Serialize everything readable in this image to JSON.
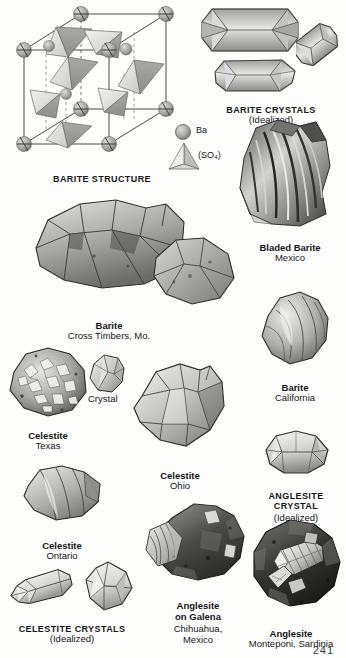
{
  "page": {
    "page_number": "241",
    "background_color": "#fdfdfb",
    "ink_color": "#15161a"
  },
  "structure_diagram": {
    "caption": "BARITE STRUCTURE",
    "legend": [
      {
        "symbol": "sphere",
        "label": "Ba"
      },
      {
        "symbol": "tetrahedron",
        "label": "(SO₄)"
      }
    ]
  },
  "figures": [
    {
      "id": "barite-crystals-idealized",
      "name": "barite-crystals-idealized",
      "caption": "BARITE CRYSTALS",
      "subcaption": "(Idealized)",
      "style": "caps"
    },
    {
      "id": "bladed-barite",
      "name": "bladed-barite-mexico",
      "caption": "Bladed Barite",
      "subcaption": "Mexico",
      "style": "bold"
    },
    {
      "id": "barite-cross-timbers",
      "name": "barite-cross-timbers-missouri",
      "caption": "Barite",
      "subcaption": "Cross Timbers, Mo.",
      "style": "bold"
    },
    {
      "id": "barite-california",
      "name": "barite-california",
      "caption": "Barite",
      "subcaption": "California",
      "style": "bold"
    },
    {
      "id": "celestite-texas",
      "name": "celestite-texas",
      "caption": "Celestite",
      "subcaption": "Texas",
      "style": "bold"
    },
    {
      "id": "celestite-texas-crystal",
      "name": "celestite-texas-crystal",
      "caption": "Crystal",
      "subcaption": "",
      "style": "plain"
    },
    {
      "id": "celestite-ohio",
      "name": "celestite-ohio",
      "caption": "Celestite",
      "subcaption": "Ohio",
      "style": "bold"
    },
    {
      "id": "anglesite-crystal-idealized",
      "name": "anglesite-crystal-idealized",
      "caption": "ANGLESITE\nCRYSTAL",
      "subcaption": "(Idealized)",
      "style": "caps"
    },
    {
      "id": "celestite-ontario",
      "name": "celestite-ontario",
      "caption": "Celestite",
      "subcaption": "Ontario",
      "style": "bold"
    },
    {
      "id": "celestite-crystals-idealized",
      "name": "celestite-crystals-idealized",
      "caption": "CELESTITE  CRYSTALS",
      "subcaption": "(Idealized)",
      "style": "caps"
    },
    {
      "id": "anglesite-on-galena",
      "name": "anglesite-on-galena-chihuahua-mexico",
      "caption": "Anglesite\non Galena",
      "subcaption": "Chihuahua,\nMexico",
      "style": "bold"
    },
    {
      "id": "anglesite-monteponi",
      "name": "anglesite-monteponi-sardinia",
      "caption": "Anglesite",
      "subcaption": "Monteponi, Sardinia",
      "style": "bold"
    }
  ]
}
